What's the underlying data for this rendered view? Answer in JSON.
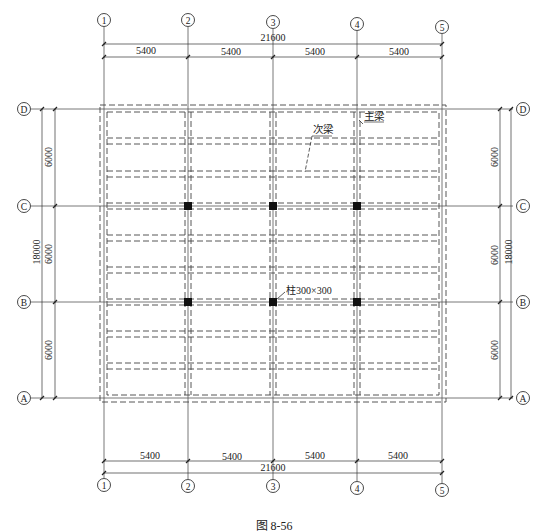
{
  "figure": {
    "caption": "图 8-56",
    "type": "structural floor framing plan"
  },
  "axes": {
    "vertical": [
      {
        "label": "1",
        "x": 104
      },
      {
        "label": "2",
        "x": 188
      },
      {
        "label": "3",
        "x": 273
      },
      {
        "label": "4",
        "x": 357
      },
      {
        "label": "5",
        "x": 442
      }
    ],
    "horizontal": [
      {
        "label": "D",
        "y": 109
      },
      {
        "label": "C",
        "y": 206
      },
      {
        "label": "B",
        "y": 302
      },
      {
        "label": "A",
        "y": 398
      }
    ]
  },
  "dimensions": {
    "top": {
      "total": "21600",
      "spans": [
        "5400",
        "5400",
        "5400",
        "5400"
      ]
    },
    "bottom": {
      "total": "21600",
      "spans": [
        "5400",
        "5400",
        "5400",
        "5400"
      ]
    },
    "left": {
      "total": "18000",
      "spans": [
        "6000",
        "6000",
        "6000"
      ]
    },
    "right": {
      "total": "18000",
      "spans": [
        "6000",
        "6000",
        "6000"
      ]
    }
  },
  "annotations": {
    "main_beam": "主梁",
    "secondary_beam": "次梁",
    "column": "柱300×300"
  },
  "columns": [
    {
      "axis": "2-C"
    },
    {
      "axis": "3-C"
    },
    {
      "axis": "4-C"
    },
    {
      "axis": "2-B"
    },
    {
      "axis": "3-B"
    },
    {
      "axis": "4-B"
    }
  ],
  "secondary_beams_per_bay": 2
}
